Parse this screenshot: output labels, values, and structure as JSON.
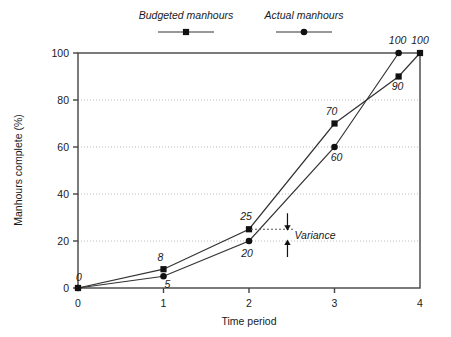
{
  "chart_data": {
    "type": "line",
    "title": "",
    "xlabel": "Time period",
    "ylabel": "Manhours complete (%)",
    "xlim": [
      0,
      4
    ],
    "ylim": [
      0,
      100
    ],
    "xticks": [
      "0",
      "1",
      "2",
      "3",
      "4"
    ],
    "yticks": [
      "0",
      "20",
      "40",
      "60",
      "80",
      "100"
    ],
    "grid": "horizontal-dotted",
    "legend_position": "top-center",
    "series": [
      {
        "name": "Budgeted manhours",
        "marker": "square",
        "x": [
          0,
          1,
          2,
          3,
          3.75,
          4
        ],
        "values": [
          0,
          8,
          25,
          70,
          90,
          100
        ],
        "point_labels": [
          "0",
          "8",
          "25",
          "70",
          "90",
          "100"
        ]
      },
      {
        "name": "Actual manhours",
        "marker": "circle",
        "x": [
          0,
          1,
          2,
          3,
          3.75
        ],
        "values": [
          0,
          5,
          20,
          60,
          100
        ],
        "point_labels": [
          "",
          "5",
          "20",
          "60",
          "100"
        ]
      }
    ],
    "annotations": [
      {
        "text": "Variance",
        "x": 2.45,
        "from_value": 25,
        "to_value": 20,
        "style": "double-arrow"
      }
    ]
  },
  "legend": {
    "items": [
      {
        "label": "Budgeted manhours",
        "marker": "square"
      },
      {
        "label": "Actual manhours",
        "marker": "circle"
      }
    ]
  },
  "colors": {
    "line": "#333333",
    "marker": "#111111",
    "axis": "#444444",
    "grid": "#b9b9b9",
    "text": "#1a1a1a",
    "background": "#ffffff"
  }
}
